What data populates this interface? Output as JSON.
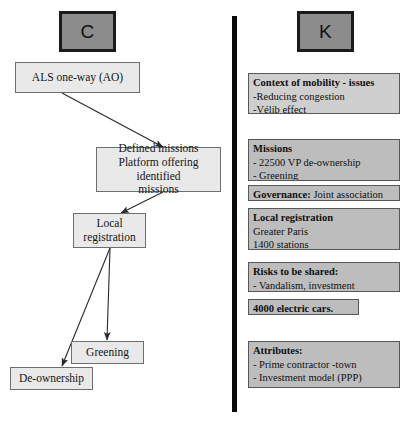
{
  "columns": {
    "left": {
      "chip_label": "C"
    },
    "right": {
      "chip_label": "K"
    }
  },
  "flowchart": {
    "type": "flow-diagram",
    "nodes": [
      {
        "id": "als",
        "lines": [
          "ALS one-way (AO)"
        ]
      },
      {
        "id": "defined-missions",
        "lines": [
          "Defined missions",
          "Platform offering identified",
          "missions"
        ]
      },
      {
        "id": "local-registration",
        "lines": [
          "Local",
          "registration"
        ]
      },
      {
        "id": "greening",
        "lines": [
          "Greening"
        ]
      },
      {
        "id": "de-ownership",
        "lines": [
          "De-ownership"
        ]
      }
    ],
    "edges": [
      {
        "from": "als",
        "to": "defined-missions"
      },
      {
        "from": "defined-missions",
        "to": "local-registration"
      },
      {
        "from": "local-registration",
        "to": "greening"
      },
      {
        "from": "local-registration",
        "to": "de-ownership"
      }
    ]
  },
  "knowledge_cards": [
    {
      "id": "context-of-mobility",
      "header": "Context of mobility - issues",
      "lines": [
        "-Reducing congestion",
        "-Vélib effect"
      ],
      "shade": "light"
    },
    {
      "id": "missions",
      "header": "Missions",
      "lines": [
        "- 22500 VP de-ownership",
        "- Greening"
      ],
      "shade": "dark"
    },
    {
      "id": "governance",
      "inline_header": "Governance:",
      "inline_value": "Joint association",
      "lines": [],
      "shade": "dark"
    },
    {
      "id": "local-registration",
      "header": "Local registration",
      "lines": [
        "Greater Paris",
        "1400 stations"
      ],
      "shade": "dark"
    },
    {
      "id": "risks-to-be-shared",
      "header": "Risks to be shared:",
      "lines": [
        "- Vandalism, investment"
      ],
      "shade": "dark"
    },
    {
      "id": "electric-cars",
      "header": "4000 electric cars.",
      "lines": [],
      "shade": "dark"
    },
    {
      "id": "attributes",
      "header": "Attributes:",
      "lines": [
        "- Prime contractor -town",
        "- Investment model (PPP)"
      ],
      "shade": "dark"
    }
  ],
  "colors": {
    "chip_fill": "#8c8c8c",
    "chip_border": "#1b1b1b",
    "node_fill": "#e9e9e9",
    "node_border": "#6e6e6e",
    "card_fill": "#bdbdbd",
    "card_fill_light": "#cfcfcf",
    "card_border": "#585858",
    "divider": "#0a0a0a",
    "arrow": "#2a2a2a",
    "page_background": "#ffffff"
  }
}
